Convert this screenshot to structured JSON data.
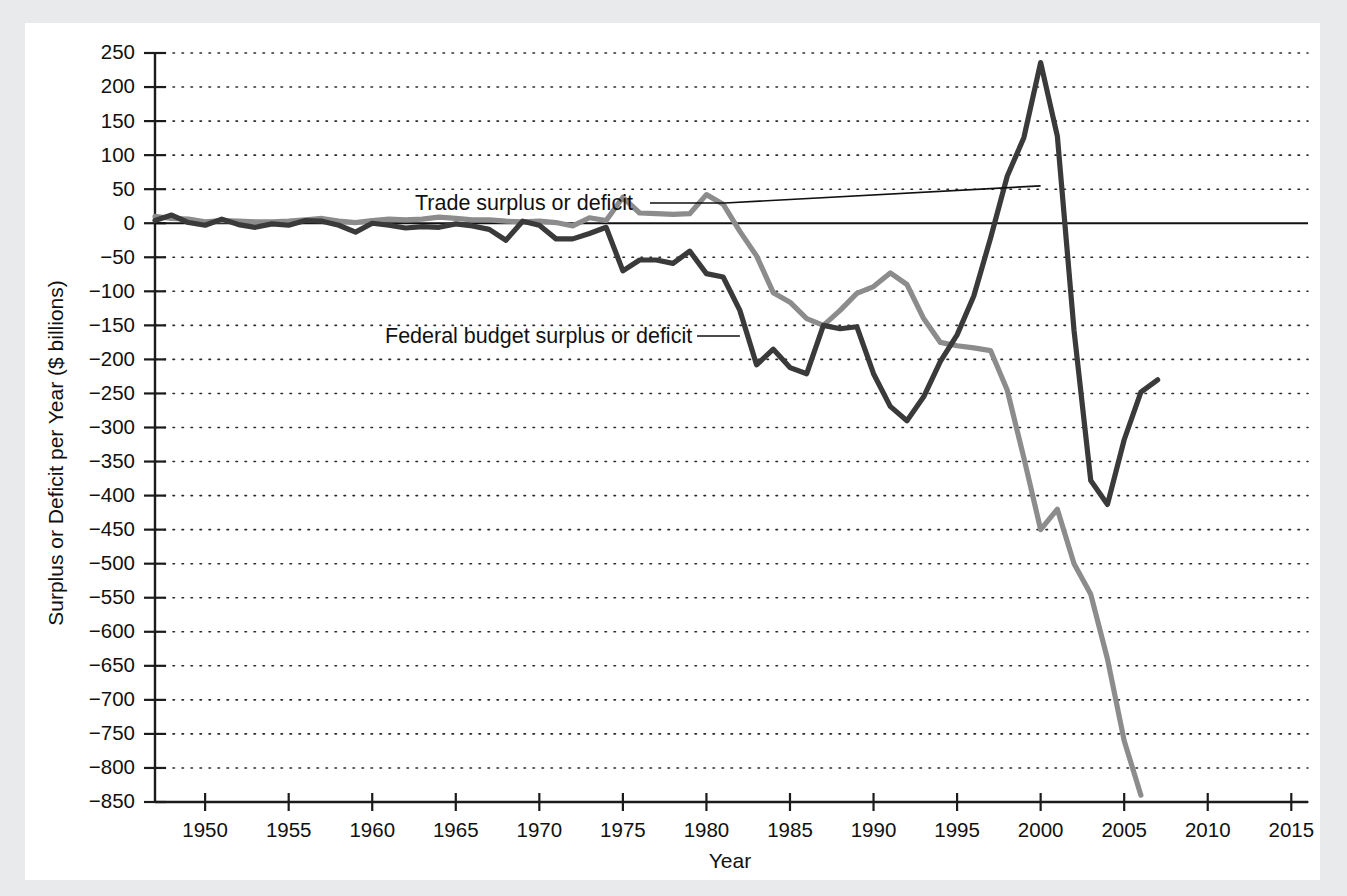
{
  "chart_data": {
    "type": "line",
    "title": "",
    "xlabel": "Year",
    "ylabel": "Surplus or Deficit per Year ($ billions)",
    "xlim": [
      1947,
      2016
    ],
    "ylim": [
      -850,
      250
    ],
    "xticks": [
      1950,
      1955,
      1960,
      1965,
      1970,
      1975,
      1980,
      1985,
      1990,
      1995,
      2000,
      2005,
      2010,
      2015
    ],
    "yticks": [
      250,
      200,
      150,
      100,
      50,
      0,
      -50,
      -100,
      -150,
      -200,
      -250,
      -300,
      -350,
      -400,
      -450,
      -500,
      -550,
      -600,
      -650,
      -700,
      -750,
      -800,
      -850
    ],
    "grid": true,
    "legend_position": "inline-annotations",
    "zero_reference_line": 0,
    "annotations": [
      {
        "text": "Trade surplus or deficit",
        "target_year": 2000,
        "target_value": 55
      },
      {
        "text": "Federal budget surplus or deficit",
        "target_year": 1982,
        "target_value": -130
      }
    ],
    "series": [
      {
        "name": "Trade surplus or deficit",
        "color": "#8c8c8c",
        "x": [
          1947,
          1948,
          1949,
          1950,
          1951,
          1952,
          1953,
          1954,
          1955,
          1956,
          1957,
          1958,
          1959,
          1960,
          1961,
          1962,
          1963,
          1964,
          1965,
          1966,
          1967,
          1968,
          1969,
          1970,
          1971,
          1972,
          1973,
          1974,
          1975,
          1976,
          1977,
          1978,
          1979,
          1980,
          1981,
          1982,
          1983,
          1984,
          1985,
          1986,
          1987,
          1988,
          1989,
          1990,
          1991,
          1992,
          1993,
          1994,
          1995,
          1996,
          1997,
          1998,
          1999,
          2000,
          2001,
          2002,
          2003,
          2004,
          2005,
          2006
        ],
        "values": [
          10,
          7,
          6,
          2,
          4,
          3,
          2,
          2,
          3,
          5,
          7,
          3,
          1,
          4,
          6,
          5,
          6,
          9,
          7,
          5,
          5,
          3,
          2,
          3,
          1,
          -4,
          8,
          4,
          38,
          15,
          14,
          13,
          14,
          42,
          28,
          -12,
          -48,
          -102,
          -116,
          -140,
          -150,
          -128,
          -103,
          -93,
          -73,
          -90,
          -140,
          -175,
          -180,
          -183,
          -187,
          -245,
          -345,
          -450,
          -420,
          -500,
          -545,
          -640,
          -760,
          -840
        ]
      },
      {
        "name": "Federal budget surplus or deficit",
        "color": "#3a3a3a",
        "x": [
          1947,
          1948,
          1949,
          1950,
          1951,
          1952,
          1953,
          1954,
          1955,
          1956,
          1957,
          1958,
          1959,
          1960,
          1961,
          1962,
          1963,
          1964,
          1965,
          1966,
          1967,
          1968,
          1969,
          1970,
          1971,
          1972,
          1973,
          1974,
          1975,
          1976,
          1977,
          1978,
          1979,
          1980,
          1981,
          1982,
          1983,
          1984,
          1985,
          1986,
          1987,
          1988,
          1989,
          1990,
          1991,
          1992,
          1993,
          1994,
          1995,
          1996,
          1997,
          1998,
          1999,
          2000,
          2001,
          2002,
          2003,
          2004,
          2005,
          2006,
          2007
        ],
        "values": [
          4,
          12,
          1,
          -3,
          6,
          -2,
          -6,
          -1,
          -3,
          4,
          3,
          -3,
          -13,
          0,
          -3,
          -7,
          -5,
          -6,
          -1,
          -4,
          -9,
          -25,
          3,
          -3,
          -23,
          -23,
          -15,
          -6,
          -70,
          -54,
          -54,
          -59,
          -41,
          -74,
          -79,
          -128,
          -208,
          -185,
          -212,
          -221,
          -150,
          -155,
          -152,
          -221,
          -269,
          -290,
          -255,
          -203,
          -164,
          -107,
          -22,
          69,
          126,
          236,
          128,
          -158,
          -378,
          -413,
          -318,
          -248,
          -230
        ]
      }
    ]
  },
  "axis": {
    "y_title": "Surplus or Deficit per Year ($ billions)",
    "x_title": "Year"
  },
  "annotations": {
    "trade_label": "Trade surplus or deficit",
    "budget_label": "Federal budget surplus or deficit"
  },
  "colors": {
    "trade_line": "#8c8c8c",
    "budget_line": "#3a3a3a",
    "background": "#e9eaec",
    "card": "#ffffff",
    "axis": "#1b1b1b"
  }
}
